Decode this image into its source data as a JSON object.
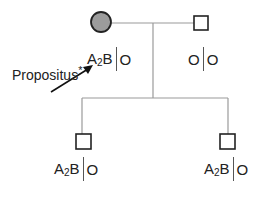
{
  "pedigree": {
    "proband_label": "Propositus",
    "proband_mark": "*",
    "colors": {
      "line": "#9a9a9a",
      "affected_fill": "#9c9c9c",
      "symbol_stroke": "#222222"
    },
    "generation1": [
      {
        "sex": "female",
        "affected": true,
        "genotype_left": "A",
        "genotype_left_sub": "2",
        "genotype_left_tail": "B",
        "genotype_right": "O"
      },
      {
        "sex": "male",
        "affected": false,
        "genotype_left": "O",
        "genotype_right": "O"
      }
    ],
    "generation2": [
      {
        "sex": "male",
        "affected": false,
        "genotype_left": "A",
        "genotype_left_sub": "2",
        "genotype_left_tail": "B",
        "genotype_right": "O"
      },
      {
        "sex": "male",
        "affected": false,
        "genotype_left": "A",
        "genotype_left_sub": "2",
        "genotype_left_tail": "B",
        "genotype_right": "O"
      }
    ]
  }
}
